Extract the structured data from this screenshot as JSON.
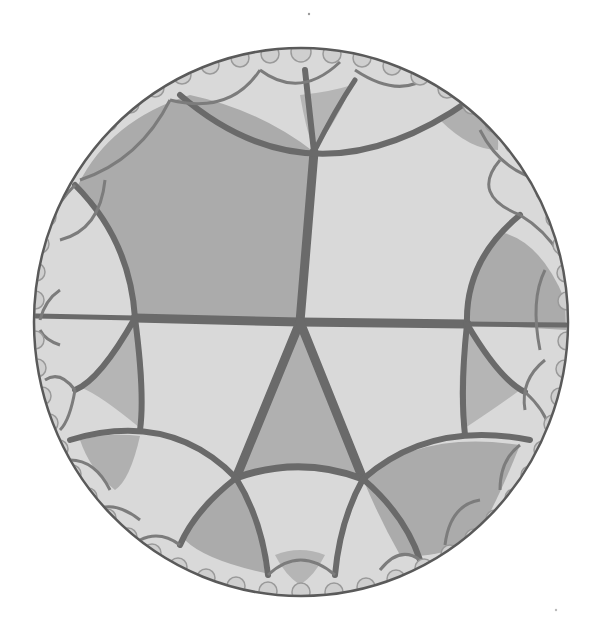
{
  "figure": {
    "disk": {
      "cx": 301,
      "cy": 322,
      "rx": 267,
      "ry": 274
    },
    "colors": {
      "background": "#ffffff",
      "light_tile": "#d9d9d9",
      "dark_tile": "#ababab",
      "edge": "#6a6a6a",
      "rim": "#5a5a5a"
    },
    "central_vertex": {
      "x": 300,
      "y": 322
    },
    "main_vertices": {
      "top": {
        "x": 314,
        "y": 152
      },
      "left": {
        "x": 135,
        "y": 318
      },
      "right": {
        "x": 467,
        "y": 324
      },
      "bottom_left": {
        "x": 236,
        "y": 478
      },
      "bottom_right": {
        "x": 363,
        "y": 479
      }
    }
  }
}
